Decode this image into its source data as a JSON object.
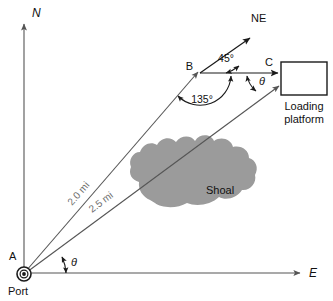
{
  "figure": {
    "type": "navigation-vector-diagram",
    "background_color": "#ffffff",
    "axes": {
      "north_label": "N",
      "east_label": "E"
    },
    "points": {
      "a_label": "A",
      "a_caption": "Port",
      "b_label": "B",
      "c_label": "C",
      "ne_label": "NE"
    },
    "distances": {
      "ab_label": "2.0 mi",
      "ac_label": "2.5 mi"
    },
    "angles": {
      "at_b_upper": "45°",
      "at_b_lower": "135°",
      "at_a": "θ",
      "at_c": "θ"
    },
    "regions": {
      "shoal_label": "Shoal",
      "shoal_color": "#9b9b9b",
      "platform_label_line1": "Loading",
      "platform_label_line2": "platform"
    },
    "icons": {
      "port_marker": "port-target-icon",
      "north_arrow": "north-arrow-icon",
      "east_arrow": "east-arrow-icon",
      "ne_arrow": "northeast-arrow-icon"
    },
    "colors": {
      "line": "#555555",
      "accent_line": "#1a1a1a",
      "text": "#111111",
      "dim_text": "#6f6f6f"
    }
  }
}
